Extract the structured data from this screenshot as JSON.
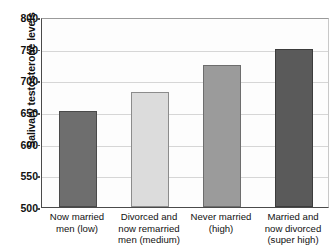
{
  "chart_data": {
    "type": "bar",
    "title": "",
    "xlabel": "",
    "ylabel": "Salivary testosterone levels",
    "ylim": [
      500,
      800
    ],
    "yticks": [
      500,
      550,
      600,
      650,
      700,
      750,
      800
    ],
    "ytick_labels": [
      "500",
      "550",
      "600",
      "650",
      "700",
      "750",
      "800"
    ],
    "grid": true,
    "legend": "none",
    "categories": [
      "Now married\nmen (low)",
      "Divorced and\nnow remarried\nmen (medium)",
      "Never married\n(high)",
      "Married and\nnow divorced\n(super high)"
    ],
    "category_lines": [
      [
        "Now married",
        "men (low)"
      ],
      [
        "Divorced and",
        "now remarried",
        "men (medium)"
      ],
      [
        "Never married",
        "(high)"
      ],
      [
        "Married and",
        "now divorced",
        "(super high)"
      ]
    ],
    "values": [
      651,
      682,
      724,
      749
    ],
    "bar_colors": [
      "#6e6e6e",
      "#dcdcdc",
      "#9b9b9b",
      "#5a5a5a"
    ],
    "bar_edge_colors": [
      "#4a4a4a",
      "#8c8c8c",
      "#6d6d6d",
      "#3c3c3c"
    ]
  }
}
